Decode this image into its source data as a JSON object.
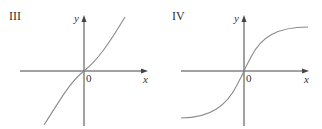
{
  "panels": [
    {
      "label": "III",
      "x_axis_label": "x",
      "y_axis_label": "y",
      "origin_label": "0",
      "curve": "odd increasing, concave-down left of origin, concave-up right of origin (cubic-like, flatter at origin)"
    },
    {
      "label": "IV",
      "x_axis_label": "x",
      "y_axis_label": "y",
      "origin_label": "0",
      "curve": "sigmoid / arctan-like, increasing, steep at origin, leveling off to horizontal asymptotes"
    }
  ],
  "colors": {
    "axis": "#444444",
    "curve": "#8a8a8a",
    "text": "#333333"
  }
}
